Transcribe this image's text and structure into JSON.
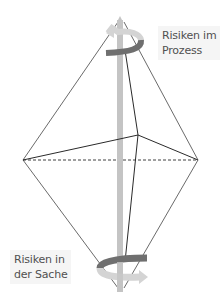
{
  "diagram": {
    "type": "octahedron-axis-rotation",
    "labels": {
      "top": "Risiken im\nProzess",
      "bottom": "Risiken in\nder Sache"
    },
    "colors": {
      "edge": "#2a2a2a",
      "pole": "#c4c4c4",
      "arrow_dark": "#6f6f6f",
      "arrow_light": "#d4d4d4",
      "label_text": "#505050",
      "label_bg": "#f5f5f5"
    }
  }
}
